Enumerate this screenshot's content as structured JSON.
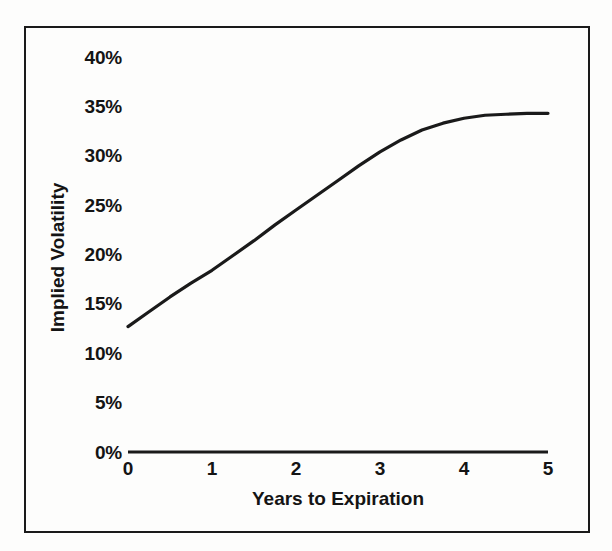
{
  "chart_data": {
    "type": "line",
    "title": "",
    "subtitle": "",
    "xlabel": "Years to Expiration",
    "ylabel": "Implied Volatility",
    "xlim": [
      0,
      5
    ],
    "ylim": [
      0,
      40
    ],
    "grid": false,
    "legend": null,
    "x_ticks": [
      "0",
      "1",
      "2",
      "3",
      "4",
      "5"
    ],
    "x_tick_values": [
      0,
      1,
      2,
      3,
      4,
      5
    ],
    "y_ticks": [
      "0%",
      "5%",
      "10%",
      "15%",
      "20%",
      "25%",
      "30%",
      "35%",
      "40%"
    ],
    "y_tick_values": [
      0,
      5,
      10,
      15,
      20,
      25,
      30,
      35,
      40
    ],
    "series": [
      {
        "name": "Implied Volatility Term Structure",
        "color": "#1a1a1a",
        "x": [
          0.0,
          0.25,
          0.5,
          0.75,
          1.0,
          1.25,
          1.5,
          1.75,
          2.0,
          2.25,
          2.5,
          2.75,
          3.0,
          3.25,
          3.5,
          3.75,
          4.0,
          4.25,
          4.5,
          4.75,
          5.0
        ],
        "values": [
          12.7,
          14.2,
          15.7,
          17.1,
          18.4,
          19.9,
          21.4,
          23.0,
          24.5,
          26.0,
          27.5,
          29.0,
          30.4,
          31.6,
          32.6,
          33.3,
          33.8,
          34.1,
          34.2,
          34.3,
          34.3
        ]
      }
    ],
    "annotations": []
  },
  "axis": {
    "x_title": "Years to Expiration",
    "y_title": "Implied Volatility"
  },
  "colors": {
    "line": "#1a1a1a",
    "axis": "#1a1a1a",
    "frame": "#1a1a1a",
    "background": "#fdfdfc",
    "text": "#141414"
  }
}
